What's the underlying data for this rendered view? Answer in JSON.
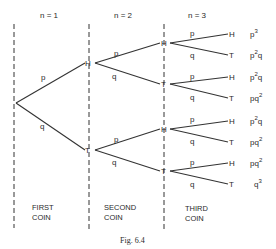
{
  "figure": {
    "caption": "Fig. 6.4",
    "columns": [
      {
        "n_label": "n = 1",
        "coin_line1": "FIRST",
        "coin_line2": "COIN"
      },
      {
        "n_label": "n = 2",
        "coin_line1": "SECOND",
        "coin_line2": "COIN"
      },
      {
        "n_label": "n = 3",
        "coin_line1": "THIRD",
        "coin_line2": "COIN"
      }
    ],
    "level1": {
      "upper": {
        "node": "H",
        "edge": "p"
      },
      "lower": {
        "node": "T",
        "edge": "q"
      }
    },
    "level2": [
      {
        "node": "H",
        "edge": "p"
      },
      {
        "node": "T",
        "edge": "q"
      },
      {
        "node": "H",
        "edge": "p"
      },
      {
        "node": "T",
        "edge": "q"
      }
    ],
    "level3": [
      {
        "node": "H",
        "edge": "p",
        "prob_base": "p",
        "prob_sup": "3",
        "prob_tail": ""
      },
      {
        "node": "T",
        "edge": "q",
        "prob_base": "p",
        "prob_sup": "2",
        "prob_tail": "q"
      },
      {
        "node": "H",
        "edge": "p",
        "prob_base": "p",
        "prob_sup": "2",
        "prob_tail": "q"
      },
      {
        "node": "T",
        "edge": "q",
        "prob_base": "pq",
        "prob_sup": "2",
        "prob_tail": ""
      },
      {
        "node": "H",
        "edge": "p",
        "prob_base": "p",
        "prob_sup": "2",
        "prob_tail": "q"
      },
      {
        "node": "T",
        "edge": "q",
        "prob_base": "pq",
        "prob_sup": "2",
        "prob_tail": ""
      },
      {
        "node": "H",
        "edge": "p",
        "prob_base": "pq",
        "prob_sup": "2",
        "prob_tail": ""
      },
      {
        "node": "T",
        "edge": "q",
        "prob_base": "q",
        "prob_sup": "3",
        "prob_tail": ""
      }
    ]
  }
}
